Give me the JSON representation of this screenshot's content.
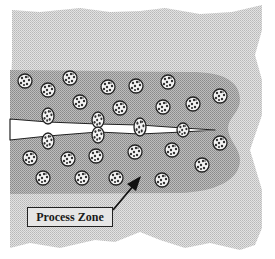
{
  "diagram": {
    "type": "fracture process zone schematic",
    "label": "Process Zone",
    "colors": {
      "matrix": "#d4d4d4",
      "process_zone": "#a8a8a8",
      "particle_fill": "#f4f4f4",
      "particle_dots": "#333333",
      "crack": "#ffffff",
      "outline": "#222222"
    },
    "particles": [
      {
        "x": 25,
        "y": 81,
        "r": 7
      },
      {
        "x": 48,
        "y": 90,
        "r": 7
      },
      {
        "x": 70,
        "y": 78,
        "r": 7
      },
      {
        "x": 80,
        "y": 102,
        "r": 7
      },
      {
        "x": 108,
        "y": 87,
        "r": 7
      },
      {
        "x": 120,
        "y": 108,
        "r": 7
      },
      {
        "x": 136,
        "y": 86,
        "r": 7
      },
      {
        "x": 168,
        "y": 82,
        "r": 7
      },
      {
        "x": 163,
        "y": 107,
        "r": 7
      },
      {
        "x": 193,
        "y": 104,
        "r": 7
      },
      {
        "x": 220,
        "y": 96,
        "r": 7
      },
      {
        "x": 30,
        "y": 158,
        "r": 7
      },
      {
        "x": 68,
        "y": 159,
        "r": 7
      },
      {
        "x": 96,
        "y": 156,
        "r": 7
      },
      {
        "x": 135,
        "y": 152,
        "r": 7
      },
      {
        "x": 172,
        "y": 150,
        "r": 7
      },
      {
        "x": 220,
        "y": 143,
        "r": 7
      },
      {
        "x": 202,
        "y": 165,
        "r": 7
      },
      {
        "x": 43,
        "y": 178,
        "r": 7
      },
      {
        "x": 82,
        "y": 178,
        "r": 7
      },
      {
        "x": 116,
        "y": 178,
        "r": 7
      },
      {
        "x": 162,
        "y": 180,
        "r": 7
      }
    ],
    "bridging_particles": [
      {
        "x": 48,
        "y": 116,
        "rx": 6,
        "ry": 8
      },
      {
        "x": 48,
        "y": 141,
        "rx": 6,
        "ry": 8
      },
      {
        "x": 98,
        "y": 120,
        "rx": 6,
        "ry": 8
      },
      {
        "x": 98,
        "y": 135,
        "rx": 6,
        "ry": 8
      },
      {
        "x": 140,
        "y": 127,
        "rx": 6,
        "ry": 9
      },
      {
        "x": 183,
        "y": 130,
        "rx": 6,
        "ry": 7
      }
    ],
    "arrow": {
      "from": [
        113,
        210
      ],
      "to": [
        140,
        178
      ]
    }
  }
}
